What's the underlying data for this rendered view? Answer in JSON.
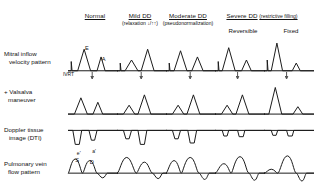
{
  "columns": [
    {
      "id": "normal",
      "title": "Normal",
      "subtitle": "",
      "x": 95
    },
    {
      "id": "mild",
      "title": "Mild DD",
      "subtitle": "(relaxation ↓/↑↑)",
      "x": 140
    },
    {
      "id": "moderate",
      "title": "Moderate DD",
      "subtitle": "(pseudonormalization)",
      "x": 188
    },
    {
      "id": "severe",
      "title": "Severe DD",
      "subtitle": "(restrictive filling)",
      "x": 262
    }
  ],
  "subcolumns": [
    {
      "id": "reversible",
      "label": "Reversible",
      "x": 243
    },
    {
      "id": "fixed",
      "label": "Fixed",
      "x": 291
    }
  ],
  "rows": [
    {
      "id": "mitral",
      "line1": "Mitral inflow",
      "line2": "velocity pattern",
      "x": 4,
      "y": 50
    },
    {
      "id": "valsalva",
      "line1": "+ Valsalva",
      "line2": "maneuver",
      "x": 4,
      "y": 88
    },
    {
      "id": "dti",
      "line1": "Doppler tissue",
      "line2": "image (DTI)",
      "x": 4,
      "y": 126
    },
    {
      "id": "pv",
      "line1": "Pulmonary vein",
      "line2": "flow pattern",
      "x": 4,
      "y": 160
    }
  ],
  "annotations": {
    "e_wave": "E",
    "a_wave": "A",
    "ivrt": "IVRT",
    "dti_e_prime": "e'",
    "dti_a_prime": "a'",
    "pv_s": "S",
    "pv_d": "D"
  },
  "colors": {
    "stroke": "#1c1c1c",
    "arrow": "#555555",
    "background": "#ffffff",
    "text": "#111111"
  },
  "chart_data": {
    "type": "line",
    "xlabel": "time",
    "ylabel": "velocity",
    "grid": false,
    "legend": "none",
    "row_order": [
      "mitral",
      "valsalva",
      "dti",
      "pv"
    ],
    "column_order": [
      "normal",
      "mild",
      "moderate",
      "reversible",
      "fixed"
    ],
    "cells": {
      "mitral": {
        "normal": {
          "path": "M0,30 L4,30 L4,18 L5,30 L12,30 L20,2 L28,30 L36,30 L41,12 L46,30 L62,30",
          "baseline": "M0,30 L62,30",
          "arrow_x": 30,
          "labels": [
            {
              "t": "E",
              "x": 21,
              "y": -3
            },
            {
              "t": "A",
              "x": 42,
              "y": 8
            }
          ],
          "desc": "E>A, normal E/A ratio ~1.5"
        },
        "mild": {
          "path": "M0,30 L4,30 L4,20 L5,30 L10,30 L18,16 L26,30 L30,30 L38,2 L46,30 L62,30",
          "baseline": "M0,30 L62,30",
          "arrow_x": 30,
          "labels": [],
          "desc": "E<A, impaired relaxation, E/A<0.8"
        },
        "moderate": {
          "path": "M0,30 L4,30 L4,20 L5,30 L10,30 L18,4 L26,30 L32,30 L39,12 L46,30 L62,30",
          "baseline": "M0,30 L62,30",
          "arrow_x": 30,
          "labels": [],
          "desc": "Pseudonormal E/A ~1-1.5"
        },
        "reversible": {
          "path": "M0,30 L4,30 L4,18 L5,30 L9,30 L17,0 L25,30 L33,30 L39,16 L45,30 L62,30",
          "baseline": "M0,30 L62,30",
          "arrow_x": 28,
          "labels": [],
          "desc": "Tall E, small A, E/A>2"
        },
        "fixed": {
          "path": "M0,30 L4,30 L4,16 L5,30 L9,30 L16,-6 L23,30 L35,30 L40,20 L45,30 L62,30",
          "baseline": "M0,30 L62,30",
          "arrow_x": 28,
          "labels": [],
          "desc": "Very tall E, minimal A, E/A>2"
        }
      },
      "valsalva": {
        "normal": {
          "path": "M0,28 L8,28 L16,6 L24,28 L31,28 L37,12 L43,28 L62,28",
          "baseline": "M0,28 L62,28",
          "labels": [],
          "desc": "E remains > A"
        },
        "mild": {
          "path": "M0,28 L8,28 L15,16 L22,28 L26,28 L34,2 L42,28 L62,28",
          "baseline": "M0,28 L62,28",
          "labels": [],
          "desc": "E<A persists"
        },
        "moderate": {
          "path": "M0,28 L8,28 L15,16 L22,28 L26,28 L34,2 L42,28 L62,28",
          "baseline": "M0,28 L62,28",
          "labels": [],
          "desc": "Reverses to E<A (unmasks)"
        },
        "reversible": {
          "path": "M0,28 L8,28 L15,16 L22,28 L26,28 L34,2 L42,28 L62,28",
          "baseline": "M0,28 L62,28",
          "labels": [],
          "desc": "Reverses to E<A with Valsalva"
        },
        "fixed": {
          "path": "M0,28 L6,28 L14,-8 L22,28 L36,28 L42,18 L48,28 L62,28",
          "baseline": "M0,28 L62,28",
          "labels": [],
          "desc": "No change, remains restrictive"
        }
      },
      "dti": {
        "normal": {
          "path": "M0,2 L6,2 L9,22 L14,22 L17,2 L26,2 L29,16 L33,16 L36,2 L62,2",
          "baseline": "M0,2 L62,2",
          "labels": [
            {
              "t": "e'",
              "x": 11,
              "y": 20
            },
            {
              "t": "a'",
              "x": 30,
              "y": 18
            }
          ],
          "desc": "Large e', e'>a'"
        },
        "mild": {
          "path": "M0,2 L8,2 L11,14 L15,14 L18,2 L26,2 L29,22 L34,22 L37,2 L62,2",
          "baseline": "M0,2 L62,2",
          "labels": [],
          "desc": "Reduced e', a'>e'"
        },
        "moderate": {
          "path": "M0,2 L8,2 L11,14 L15,14 L18,2 L27,2 L30,20 L35,20 L38,2 L62,2",
          "baseline": "M0,2 L62,2",
          "labels": [],
          "desc": "Reduced e' persists"
        },
        "reversible": {
          "path": "M0,2 L9,2 L11,10 L15,10 L17,2 L28,2 L30,11 L35,11 L37,2 L62,2",
          "baseline": "M0,2 L62,2",
          "labels": [],
          "desc": "Markedly reduced e' and a'"
        },
        "fixed": {
          "path": "M0,2 L9,2 L11,9 L15,9 L17,2 L28,2 L30,10 L35,10 L37,2 L62,2",
          "baseline": "M0,2 L62,2",
          "labels": [],
          "desc": "Markedly reduced e' and a'"
        }
      },
      "pv": {
        "normal": {
          "path": "M0,22 C2,22 4,4 9,4 C14,4 16,22 18,22 C20,22 22,6 27,6 C32,6 34,22 36,22 C38,22 40,28 43,28 C46,28 47,22 49,22 L62,22",
          "baseline": "M0,22 L62,22",
          "labels": [
            {
              "t": "S",
              "x": 9,
              "y": 1
            },
            {
              "t": "D",
              "x": 27,
              "y": 3
            }
          ],
          "desc": "S>D, small Ar"
        },
        "mild": {
          "path": "M0,22 C3,22 6,2 12,2 C18,2 21,22 24,22 C26,22 29,8 34,8 C39,8 41,22 44,22 C46,22 48,29 51,29 C54,29 55,22 57,22 L62,22",
          "baseline": "M0,22 L62,22",
          "labels": [],
          "desc": "S>D accentuated"
        },
        "moderate": {
          "path": "M0,22 C2,22 5,6 10,6 C15,6 17,22 19,22 C21,22 24,2 30,2 C36,2 38,22 41,22 C43,22 45,30 48,30 C51,30 52,22 54,22 L62,22",
          "baseline": "M0,22 L62,22",
          "labels": [],
          "desc": "S<D, Ar deeper"
        },
        "reversible": {
          "path": "M0,22 C3,22 6,10 11,10 C16,10 18,22 20,22 C22,22 25,1 31,1 C37,1 39,22 42,22 C44,22 46,31 49,31 C52,31 53,22 55,22 L62,22",
          "baseline": "M0,22 L62,22",
          "labels": [],
          "desc": "S<<D, prominent Ar"
        },
        "fixed": {
          "path": "M0,22 C3,22 5,17 9,17 C13,17 15,22 17,22 C20,22 23,0 29,0 C35,0 37,22 40,22 C42,22 44,32 47,32 C50,32 51,22 53,22 L62,22",
          "baseline": "M0,22 L62,22",
          "labels": [],
          "desc": "Blunted S, dominant D, deep Ar"
        }
      }
    }
  }
}
